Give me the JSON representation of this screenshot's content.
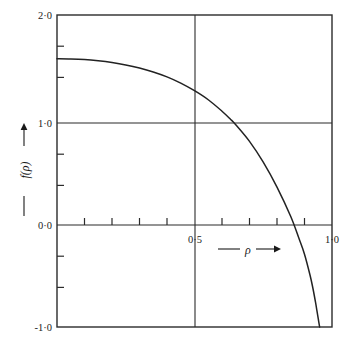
{
  "chart_data": {
    "type": "line",
    "title": "",
    "subtitle": "",
    "xlabel": "—ρ→",
    "ylabel": "—f(ρ)→",
    "xlim": [
      0.0,
      1.0
    ],
    "ylim": [
      -1.0,
      2.0
    ],
    "grid": true,
    "legend": null,
    "x_tick_labels": [
      "0·5",
      "1·0"
    ],
    "x_tick_label_values": [
      0.5,
      1.0
    ],
    "x_minor_ticks": [
      0.1,
      0.2,
      0.3,
      0.4,
      0.5,
      0.6,
      0.7,
      0.8,
      0.9,
      1.0
    ],
    "y_tick_labels": [
      "2·0",
      "1·0",
      "0·0",
      "-1·0"
    ],
    "y_tick_label_values": [
      2.0,
      1.0,
      0.0,
      -1.0
    ],
    "y_minor_ticks": [
      -0.7,
      -0.3,
      0.3,
      0.7,
      1.3,
      1.7
    ],
    "gridlines": {
      "vertical_at_x": 0.5,
      "horizontal_at_y": 1.0
    },
    "series": [
      {
        "name": "—f(ρ)",
        "x": [
          0.0,
          0.05,
          0.1,
          0.15,
          0.2,
          0.25,
          0.3,
          0.35,
          0.4,
          0.45,
          0.5,
          0.55,
          0.6,
          0.63,
          0.65,
          0.7,
          0.75,
          0.8,
          0.85,
          0.88,
          0.9,
          0.92,
          0.93,
          0.94,
          0.945,
          0.95,
          0.955
        ],
        "values": [
          1.58,
          1.578,
          1.572,
          1.56,
          1.543,
          1.52,
          1.49,
          1.452,
          1.405,
          1.345,
          1.272,
          1.185,
          1.075,
          1.0,
          0.945,
          0.785,
          0.585,
          0.345,
          0.062,
          -0.15,
          -0.3,
          -0.5,
          -0.62,
          -0.76,
          -0.84,
          -0.92,
          -1.0
        ]
      }
    ],
    "annotations": []
  },
  "figure": {
    "background_color": "#ffffff",
    "line_color": "#222222",
    "axis_color": "#2b2b2b",
    "text_color": "#1a1a1a"
  }
}
